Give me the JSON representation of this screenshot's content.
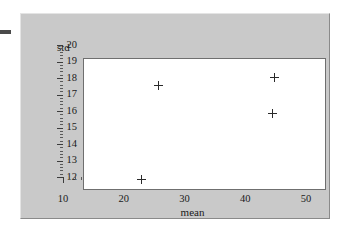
{
  "figure": {
    "left_margin_glyph": "-",
    "panel_background": "#c9c9c9",
    "plot_background": "#ffffff",
    "marker_color": "#2a2a2a",
    "axis_color": "#3c3c3c"
  },
  "chart_data": {
    "type": "scatter",
    "title": "",
    "xlabel": "mean",
    "ylabel": "std",
    "xlim": [
      10,
      50
    ],
    "ylim": [
      12,
      20
    ],
    "xticks": [
      10,
      20,
      30,
      40,
      50
    ],
    "yticks": [
      12,
      13,
      14,
      15,
      16,
      17,
      18,
      19,
      20
    ],
    "xtick_labels": [
      "10",
      "20",
      "30",
      "40",
      "50"
    ],
    "ytick_labels": [
      "12",
      "13",
      "14",
      "15",
      "16",
      "17",
      "18",
      "19",
      "20"
    ],
    "x_minor_tick_interval": 1,
    "y_minor_tick_interval": 0.2,
    "grid": false,
    "legend": null,
    "marker_style": "plus",
    "points": [
      {
        "x": 19.4,
        "y": 12.7
      },
      {
        "x": 22.2,
        "y": 18.4
      },
      {
        "x": 41.1,
        "y": 16.7
      },
      {
        "x": 41.3,
        "y": 18.9
      }
    ],
    "series": [
      {
        "name": "",
        "x": [
          19.4,
          22.2,
          41.1,
          41.3
        ],
        "values": [
          12.7,
          18.4,
          16.7,
          18.9
        ]
      }
    ]
  }
}
